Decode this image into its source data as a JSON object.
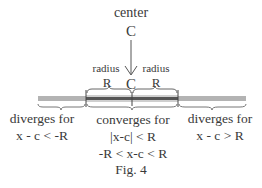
{
  "figure": {
    "caption": "Fig. 4",
    "center": {
      "label": "center",
      "symbol": "C"
    },
    "point_on_line": "C",
    "radius_left": {
      "label": "radius",
      "symbol": "R"
    },
    "radius_right": {
      "label": "radius",
      "symbol": "R"
    },
    "regions": [
      {
        "id": "left",
        "lines": [
          "diverges for",
          "x - c < -R"
        ]
      },
      {
        "id": "middle",
        "lines": [
          "converges for",
          "|x-c| < R",
          "-R < x-c < R"
        ]
      },
      {
        "id": "right",
        "lines": [
          "diverges for",
          "x - c > R"
        ]
      }
    ],
    "colors": {
      "line_outer": "#a8a8a8",
      "line_inner": "#5a5a5a",
      "text": "#3a3a3a"
    }
  }
}
